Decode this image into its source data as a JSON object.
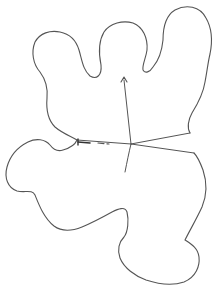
{
  "drawing": {
    "width": 219,
    "height": 293,
    "stroke_color": "#555555",
    "background": "#ffffff",
    "upper_outline": "M77,140 C70,136 62,133 55,127 C48,120 46,110 47,98 C48,88 46,80 40,72 C33,64 31,52 35,42 C40,33 50,30 60,32 C70,34 76,40 79,50 C82,60 83,70 90,76 C97,80 102,75 101,65 C99,55 98,42 104,32 C110,23 123,20 133,23 C143,27 148,38 147,50 C146,58 142,65 143,70 C145,74 150,72 153,67 C159,60 162,50 163,40 C163,28 165,16 175,10 C186,4 200,6 206,18 C213,30 212,44 210,54 C208,62 207,72 205,82 C203,95 197,105 192,113 C188,120 187,128 190,133",
    "lower_outline": "M77,140 C75,145 70,148 63,150 C57,152 53,149 50,145 C45,139 36,138 28,142 C18,147 10,156 7,167 C4,178 8,188 17,191 C25,193 32,189 35,195 C39,205 44,218 54,226 C62,232 72,231 82,227 C94,222 103,217 112,212 C118,209 125,206 127,212 C129,220 128,232 124,237 C119,242 117,250 120,258 C124,268 135,276 146,280 C158,284 172,286 184,282 C196,277 200,266 199,257 C198,248 191,244 185,240 C190,230 197,218 202,207 C207,195 207,182 203,170 C200,162 197,156 194,153",
    "spokes": [
      {
        "id": "left",
        "d": "M131,144 L77,140"
      },
      {
        "id": "right-upper",
        "d": "M131,144 L190,133"
      },
      {
        "id": "right-lower",
        "d": "M131,144 L194,153"
      },
      {
        "id": "down",
        "d": "M131,144 C129,152 127,162 125,172"
      },
      {
        "id": "up-arrow",
        "d": "M131,144 L124,80"
      }
    ],
    "dashed_segment": {
      "d": "M98,143 L109,144",
      "dash": "6,3"
    },
    "left_arrowhead": {
      "d": "M78,142 L90,143",
      "tip": "M78,139 L78,145"
    },
    "up_arrowhead": {
      "d": "M121,82 L124,77 L127,82"
    }
  }
}
